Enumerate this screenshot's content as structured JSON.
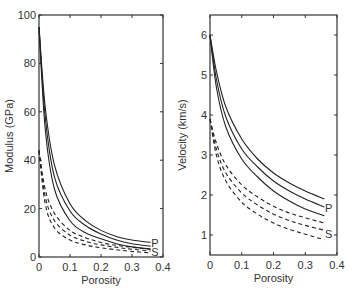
{
  "chart_data": [
    {
      "type": "line",
      "title": "",
      "xlabel": "Porosity",
      "ylabel": "Modulus (GPa)",
      "xlim": [
        0,
        0.4
      ],
      "ylim": [
        0,
        100
      ],
      "xticks": [
        "0",
        "0.1",
        "0.2",
        "0.3",
        "0.4"
      ],
      "yticks": [
        "0",
        "20",
        "40",
        "60",
        "80",
        "100"
      ],
      "grid": false,
      "annotations": [
        "P",
        "S"
      ],
      "x": [
        0,
        0.02,
        0.05,
        0.1,
        0.15,
        0.2,
        0.25,
        0.3,
        0.36
      ],
      "series": [
        {
          "name": "P-1",
          "style": "solid",
          "values": [
            95,
            62,
            38,
            22,
            15,
            11,
            8.5,
            7,
            6
          ]
        },
        {
          "name": "P-2",
          "style": "solid",
          "values": [
            95,
            58,
            33,
            19,
            13,
            9.5,
            7,
            5.5,
            4.5
          ]
        },
        {
          "name": "P-3",
          "style": "solid",
          "values": [
            95,
            53,
            28,
            15,
            10,
            7.5,
            5.5,
            4.2,
            3.3
          ]
        },
        {
          "name": "S-1",
          "style": "dashed",
          "values": [
            44,
            28,
            18,
            11,
            8,
            6,
            4.8,
            4,
            3.2
          ]
        },
        {
          "name": "S-2",
          "style": "dashed",
          "values": [
            44,
            25,
            15,
            9,
            6.5,
            5,
            4,
            3.2,
            2.5
          ]
        },
        {
          "name": "S-3",
          "style": "dashed",
          "values": [
            44,
            22,
            12,
            7,
            5,
            3.8,
            3,
            2.3,
            1.7
          ]
        }
      ]
    },
    {
      "type": "line",
      "title": "",
      "xlabel": "Porosity",
      "ylabel": "Velocity (km/s)",
      "xlim": [
        0,
        0.4
      ],
      "ylim": [
        0.5,
        6.5
      ],
      "xticks": [
        "0",
        "0.1",
        "0.2",
        "0.3",
        "0.4"
      ],
      "yticks": [
        "1",
        "2",
        "3",
        "4",
        "5",
        "6"
      ],
      "grid": false,
      "annotations": [
        "P",
        "S"
      ],
      "x": [
        0,
        0.02,
        0.05,
        0.1,
        0.15,
        0.2,
        0.25,
        0.3,
        0.36
      ],
      "series": [
        {
          "name": "P-1",
          "style": "solid",
          "values": [
            6.0,
            5.1,
            4.2,
            3.4,
            2.9,
            2.55,
            2.3,
            2.1,
            1.9
          ]
        },
        {
          "name": "P-2",
          "style": "solid",
          "values": [
            6.0,
            4.9,
            3.95,
            3.15,
            2.7,
            2.35,
            2.1,
            1.9,
            1.7
          ]
        },
        {
          "name": "P-3",
          "style": "solid",
          "values": [
            6.0,
            4.7,
            3.7,
            2.9,
            2.45,
            2.1,
            1.85,
            1.65,
            1.48
          ]
        },
        {
          "name": "S-1",
          "style": "dashed",
          "values": [
            3.9,
            3.3,
            2.75,
            2.25,
            1.95,
            1.72,
            1.55,
            1.43,
            1.3
          ]
        },
        {
          "name": "S-2",
          "style": "dashed",
          "values": [
            3.9,
            3.15,
            2.55,
            2.05,
            1.75,
            1.52,
            1.36,
            1.24,
            1.12
          ]
        },
        {
          "name": "S-3",
          "style": "dashed",
          "values": [
            3.9,
            3.0,
            2.35,
            1.82,
            1.52,
            1.3,
            1.14,
            1.02,
            0.88
          ]
        }
      ]
    }
  ],
  "labels": {
    "left": {
      "xlabel": "Porosity",
      "ylabel": "Modulus (GPa)",
      "p": "P",
      "s": "S"
    },
    "right": {
      "xlabel": "Porosity",
      "ylabel": "Velocity (km/s)",
      "p": "P",
      "s": "S"
    }
  }
}
